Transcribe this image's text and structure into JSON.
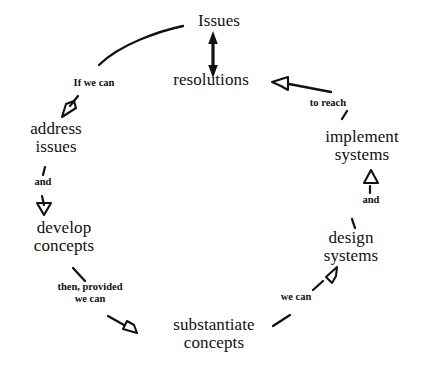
{
  "diagram": {
    "type": "cycle-diagram",
    "title": "",
    "background_color": "#ffffff",
    "stroke_color": "#111111",
    "nodes": [
      {
        "id": "issues",
        "label_line1": "Issues",
        "label_line2": ""
      },
      {
        "id": "resolutions",
        "label_line1": "resolutions",
        "label_line2": ""
      },
      {
        "id": "implement-systems",
        "label_line1": "implement",
        "label_line2": "systems"
      },
      {
        "id": "design-systems",
        "label_line1": "design",
        "label_line2": "systems"
      },
      {
        "id": "substantiate-concepts",
        "label_line1": "substantiate",
        "label_line2": "concepts"
      },
      {
        "id": "develop-concepts",
        "label_line1": "develop",
        "label_line2": "concepts"
      },
      {
        "id": "address-issues",
        "label_line1": "address",
        "label_line2": "issues"
      }
    ],
    "edge_labels": [
      {
        "id": "if-we-can",
        "line1": "If we can",
        "line2": ""
      },
      {
        "id": "and-left",
        "line1": "and",
        "line2": ""
      },
      {
        "id": "then-provided-we-can",
        "line1": "then, provided",
        "line2": "we can"
      },
      {
        "id": "we-can",
        "line1": "we can",
        "line2": ""
      },
      {
        "id": "and-right",
        "line1": "and",
        "line2": ""
      },
      {
        "id": "to-reach",
        "line1": "to reach",
        "line2": ""
      }
    ],
    "edges": [
      {
        "from": "issues",
        "to": "resolutions",
        "label": "",
        "arrow": "double-solid"
      },
      {
        "from": "issues",
        "to": "address-issues",
        "label": "If we can",
        "arrow": "open-single"
      },
      {
        "from": "address-issues",
        "to": "develop-concepts",
        "label": "and",
        "arrow": "open-single"
      },
      {
        "from": "develop-concepts",
        "to": "substantiate-concepts",
        "label": "then, provided we can",
        "arrow": "open-single"
      },
      {
        "from": "substantiate-concepts",
        "to": "design-systems",
        "label": "we can",
        "arrow": "open-single"
      },
      {
        "from": "design-systems",
        "to": "implement-systems",
        "label": "and",
        "arrow": "open-single"
      },
      {
        "from": "implement-systems",
        "to": "resolutions",
        "label": "to reach",
        "arrow": "open-single"
      }
    ]
  }
}
